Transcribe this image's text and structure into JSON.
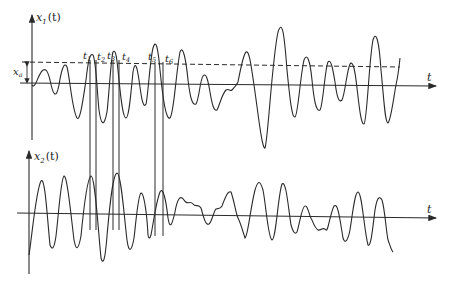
{
  "diagram": {
    "type": "signal-threshold-crossing",
    "colors": {
      "stroke": "#2a2a2a",
      "background": "#ffffff"
    },
    "top_plot": {
      "y_label": "x",
      "y_label_sub": "1",
      "y_label_arg": "(t)",
      "x_label": "t",
      "threshold_label": "x",
      "threshold_label_sub": "a",
      "crossing_labels": [
        {
          "name": "t",
          "sub": "1"
        },
        {
          "name": "t",
          "sub": "2"
        },
        {
          "name": "t",
          "sub": "3"
        },
        {
          "name": "t",
          "sub": "4"
        },
        {
          "name": "t",
          "sub": "5"
        },
        {
          "name": "t",
          "sub": "6"
        }
      ]
    },
    "bottom_plot": {
      "y_label": "x",
      "y_label_sub": "2",
      "y_label_arg": "(t)",
      "x_label": "t"
    }
  }
}
